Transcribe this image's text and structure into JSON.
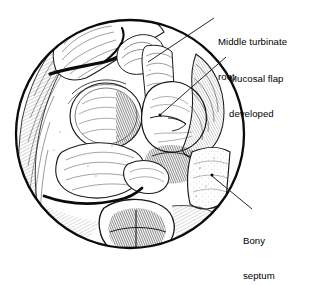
{
  "figure": {
    "kind": "medical-line-illustration",
    "view": "circular endoscopic view of nasal cavity",
    "background_color": "#ffffff",
    "ink_color": "#1a1a1a",
    "circle": {
      "cx": 130,
      "cy": 134,
      "r": 116
    }
  },
  "labels": {
    "middle_turbinate_root": {
      "line1": "Middle turbinate",
      "line2": "root"
    },
    "mucosal_flap": {
      "line1": "Mucosal flap",
      "line2": "developed"
    },
    "bony_septum": {
      "line1": "Bony",
      "line2": "septum"
    }
  },
  "leaders": [
    {
      "name": "middle-turbinate-root-leader",
      "from_x": 214,
      "from_y": 18,
      "to_x": 148,
      "to_y": 62,
      "dot_x": 148,
      "dot_y": 62
    },
    {
      "name": "mucosal-flap-leader",
      "from_x": 226,
      "from_y": 56,
      "to_x": 160,
      "to_y": 115,
      "dot_x": 160,
      "dot_y": 115
    },
    {
      "name": "bony-septum-leader",
      "from_x": 252,
      "from_y": 208,
      "to_x": 212,
      "to_y": 175,
      "dot_x": 212,
      "dot_y": 175
    }
  ]
}
